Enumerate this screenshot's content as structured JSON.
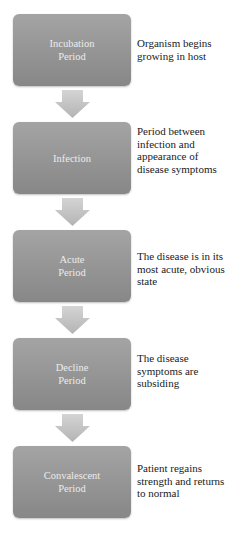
{
  "diagram": {
    "type": "vertical-flowchart",
    "stages": [
      {
        "label": "Incubation\nPeriod",
        "description": "Organism begins growing in host"
      },
      {
        "label": "Infection",
        "description": "Period between infection and appearance of disease symptoms"
      },
      {
        "label": "Acute\nPeriod",
        "description": "The disease is in its most acute, obvious state"
      },
      {
        "label": "Decline\nPeriod",
        "description": "The disease symptoms are subsiding"
      },
      {
        "label": "Convalescent\nPeriod",
        "description": "Patient regains strength and returns to normal"
      }
    ],
    "colors": {
      "box": "#959595",
      "box_text": "#ececec",
      "arrow": "#c4c4c4",
      "description_text": "#1a1a1a"
    }
  }
}
